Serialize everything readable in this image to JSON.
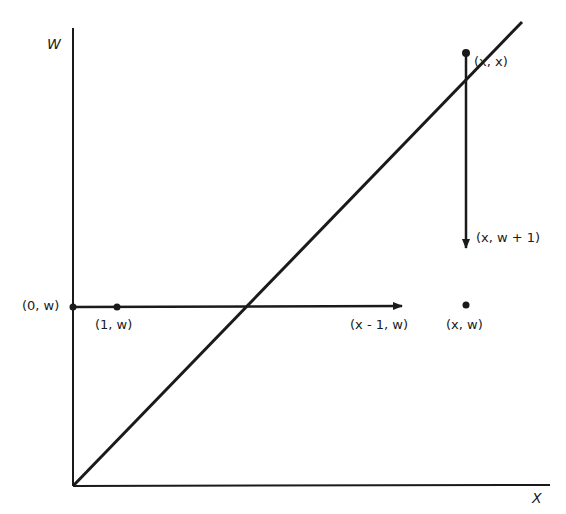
{
  "diagram": {
    "axes": {
      "y_label": "W",
      "x_label": "X"
    },
    "points": [
      {
        "id": "p0w",
        "label": "(0, w)"
      },
      {
        "id": "p1w",
        "label": "(1, w)"
      },
      {
        "id": "pxm1w",
        "label": "(x - 1, w)"
      },
      {
        "id": "pxw",
        "label": "(x, w)"
      },
      {
        "id": "pxx",
        "label": "(x, x)"
      },
      {
        "id": "pxw1",
        "label": "(x, w + 1)"
      }
    ],
    "lines": [
      {
        "id": "diagonal",
        "description": "line W = X from origin"
      },
      {
        "id": "horizontal-arrow",
        "description": "arrow from (0, w) to (x - 1, w)"
      },
      {
        "id": "vertical-arrow",
        "description": "arrow from (x, x) down to (x, w + 1)"
      }
    ],
    "colors": {
      "stroke": "#1a1a1a",
      "background": "#ffffff"
    }
  }
}
